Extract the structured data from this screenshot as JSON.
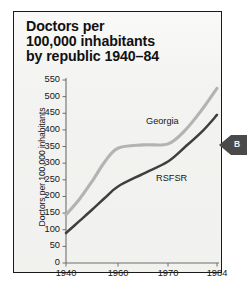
{
  "figure": {
    "title_lines": "Doctors per\n100,000 inhabitants\nby republic 1940–84",
    "panel_bg": "#f2f2f0",
    "frame_color": "#1a1a1a"
  },
  "marker": {
    "name": "left-pointing-tab",
    "letter": "B",
    "color": "#4a4a4a"
  },
  "chart_data": {
    "type": "line",
    "title": "Doctors per 100,000 inhabitants by republic 1940–84",
    "subtitle": "",
    "xlabel": "",
    "ylabel": "Doctors per 100,000 inhabitants",
    "x": [
      1940,
      1960,
      1970,
      1984
    ],
    "xtick_labels": [
      "1940",
      "1960",
      "1970",
      "1984"
    ],
    "xlim": [
      1940,
      1984
    ],
    "ylim": [
      0,
      550
    ],
    "ytick_labels": [
      "0",
      "50",
      "100",
      "150",
      "200",
      "250",
      "300",
      "350",
      "400",
      "450",
      "500",
      "550"
    ],
    "ytick_values": [
      0,
      50,
      100,
      150,
      200,
      250,
      300,
      350,
      400,
      450,
      500,
      550
    ],
    "grid": false,
    "legend_position": "inline-annotation",
    "series": [
      {
        "name": "Georgia",
        "color": "#b3b3b3",
        "label_x": 1968,
        "label_y": 425,
        "values": [
          145,
          345,
          358,
          525
        ],
        "dense_x": [
          1940,
          1945,
          1950,
          1955,
          1960,
          1965,
          1970,
          1975,
          1980,
          1984
        ],
        "dense_values": [
          145,
          190,
          245,
          305,
          345,
          355,
          358,
          400,
          465,
          525
        ]
      },
      {
        "name": "RSFSR",
        "color": "#3f3f3f",
        "label_x": 1970,
        "label_y": 252,
        "values": [
          90,
          230,
          305,
          445
        ],
        "dense_x": [
          1940,
          1945,
          1950,
          1955,
          1960,
          1965,
          1970,
          1975,
          1980,
          1984
        ],
        "dense_values": [
          90,
          125,
          160,
          196,
          230,
          268,
          305,
          350,
          398,
          445
        ]
      }
    ]
  }
}
